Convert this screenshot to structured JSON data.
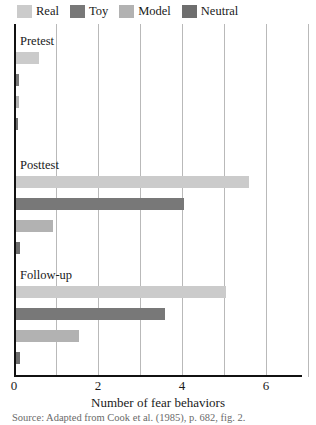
{
  "legend": {
    "position": "top-left",
    "entries": [
      {
        "label": "Real",
        "color": "#cbcbcb"
      },
      {
        "label": "Toy",
        "color": "#787878"
      },
      {
        "label": "Model",
        "color": "#b2b2b2"
      },
      {
        "label": "Neutral",
        "color": "#6e6e6e"
      }
    ]
  },
  "axis": {
    "x_tick_labels": [
      "0",
      "2",
      "4",
      "6"
    ],
    "x_tick_values": [
      0,
      2,
      4,
      6
    ],
    "x_gridline_values": [
      1,
      2,
      3,
      4,
      5,
      6,
      7
    ],
    "xlabel": "Number of fear behaviors"
  },
  "groups": [
    {
      "label": "Pretest"
    },
    {
      "label": "Posttest"
    },
    {
      "label": "Follow-up"
    }
  ],
  "source_note": "Source: Adapted from Cook et al. (1985), p. 682, fig. 2.",
  "chart_data": {
    "type": "bar",
    "orientation": "horizontal",
    "title": "",
    "subtitle": "",
    "xlabel": "Number of fear behaviors",
    "ylabel": "",
    "xlim": [
      0,
      7
    ],
    "ylim": null,
    "grid": "vertical",
    "legend_position": "top-left",
    "categories": [
      "Pretest",
      "Posttest",
      "Follow-up"
    ],
    "series": [
      {
        "name": "Real",
        "color": "#cbcbcb",
        "values": [
          0.55,
          5.55,
          5.0
        ]
      },
      {
        "name": "Toy",
        "color": "#787878",
        "values": [
          0.08,
          4.0,
          3.55
        ]
      },
      {
        "name": "Model",
        "color": "#b2b2b2",
        "values": [
          0.08,
          0.88,
          1.5
        ]
      },
      {
        "name": "Neutral",
        "color": "#6e6e6e",
        "values": [
          0.05,
          0.1,
          0.1
        ]
      }
    ],
    "annotations": [
      "Source: Adapted from Cook et al. (1985), p. 682, fig. 2."
    ]
  }
}
